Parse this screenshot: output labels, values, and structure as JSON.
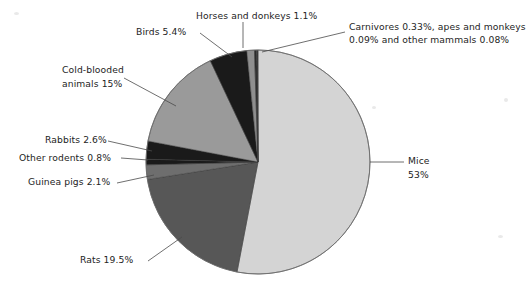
{
  "chart_data": {
    "type": "pie",
    "title": "",
    "subtitle": "",
    "xlabel": "",
    "ylabel": "",
    "legend_position": "callout-labels",
    "grid": false,
    "units": "percent",
    "total": 100,
    "start_angle_deg": 0,
    "direction": "clockwise",
    "categories": [
      "Mice",
      "Rats",
      "Guinea pigs",
      "Other rodents",
      "Rabbits",
      "Cold-blooded animals",
      "Birds",
      "Horses and donkeys",
      "Carnivores",
      "Apes and monkeys",
      "Other mammals"
    ],
    "values": [
      53,
      19.5,
      2.1,
      0.8,
      2.6,
      15,
      5.4,
      1.1,
      0.33,
      0.09,
      0.08
    ],
    "slices": [
      {
        "name": "Mice",
        "value": 53,
        "value_text": "53%",
        "color": "#d4d4d4"
      },
      {
        "name": "Rats",
        "value": 19.5,
        "value_text": "19.5%",
        "color": "#575757"
      },
      {
        "name": "Guinea pigs",
        "value": 2.1,
        "value_text": "2.1%",
        "color": "#6e6e6e"
      },
      {
        "name": "Other rodents",
        "value": 0.8,
        "value_text": "0.8%",
        "color": "#1a1a1a"
      },
      {
        "name": "Rabbits",
        "value": 2.6,
        "value_text": "2.6%",
        "color": "#1a1a1a"
      },
      {
        "name": "Cold-blooded animals",
        "value": 15,
        "value_text": "15%",
        "color": "#9a9a9a"
      },
      {
        "name": "Birds",
        "value": 5.4,
        "value_text": "5.4%",
        "color": "#1a1a1a"
      },
      {
        "name": "Horses and donkeys",
        "value": 1.1,
        "value_text": "1.1%",
        "color": "#8f8f8f"
      },
      {
        "name": "Carnivores",
        "value": 0.33,
        "value_text": "0.33%",
        "color": "#2b2b2b"
      },
      {
        "name": "Apes and monkeys",
        "value": 0.09,
        "value_text": "0.09%",
        "color": "#5a5a5a"
      },
      {
        "name": "Other mammals",
        "value": 0.08,
        "value_text": "0.08%",
        "color": "#1a1a1a"
      }
    ]
  },
  "labels": {
    "horses_and_donkeys": "Horses and donkeys 1.1%",
    "carnivores_group_line1": "Carnivores 0.33%, apes and monkeys",
    "carnivores_group_line2": "0.09% and other mammals 0.08%",
    "birds": "Birds 5.4%",
    "cold_blooded_line1": "Cold-blooded",
    "cold_blooded_line2": "animals 15%",
    "rabbits": "Rabbits 2.6%",
    "other_rodents": "Other rodents 0.8%",
    "guinea_pigs": "Guinea pigs 2.1%",
    "rats": "Rats 19.5%",
    "mice_line1": "Mice",
    "mice_line2": "53%"
  },
  "style": {
    "background": "#ffffff",
    "outline": "#6d6d6d",
    "leader_line": "#4a4a4a",
    "text": "#242424"
  }
}
